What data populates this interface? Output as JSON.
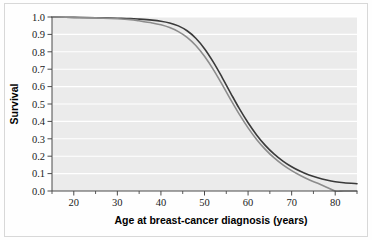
{
  "figure": {
    "background_color": "#fefefe",
    "frame_color": "#d8d8d8",
    "plot_background_color": "#ebebeb",
    "gridline_color": "#ffffff",
    "axis_color": "#4a4a4a"
  },
  "chart_data": {
    "type": "line",
    "title": "",
    "subtitle": "",
    "xlabel": "Age at breast-cancer diagnosis (years)",
    "ylabel": "Survival",
    "xlim": [
      15,
      85
    ],
    "ylim": [
      0.0,
      1.0
    ],
    "grid": true,
    "grid_axis": "y",
    "legend": "none",
    "xticks": [
      20,
      30,
      40,
      50,
      60,
      70,
      80
    ],
    "xtick_labels": [
      "20",
      "30",
      "40",
      "50",
      "60",
      "70",
      "80"
    ],
    "xminor_ticks": [
      15,
      25,
      35,
      45,
      55,
      65,
      75,
      85
    ],
    "yticks": [
      0.0,
      0.1,
      0.2,
      0.3,
      0.4,
      0.5,
      0.6,
      0.7,
      0.8,
      0.9,
      1.0
    ],
    "ytick_labels": [
      "0.0",
      "0.1",
      "0.2",
      "0.3",
      "0.4",
      "0.5",
      "0.6",
      "0.7",
      "0.8",
      "0.9",
      "1.0"
    ],
    "x": [
      15,
      20,
      25,
      30,
      33,
      35,
      38,
      40,
      42,
      44,
      46,
      48,
      50,
      52,
      54,
      56,
      58,
      60,
      62,
      64,
      66,
      68,
      70,
      72,
      74,
      76,
      78,
      80,
      82,
      85
    ],
    "series": [
      {
        "name": "dark-curve",
        "color": "#3a3a3a",
        "width": 1.6,
        "values": [
          1.0,
          0.998,
          0.996,
          0.993,
          0.991,
          0.988,
          0.982,
          0.976,
          0.966,
          0.949,
          0.921,
          0.878,
          0.818,
          0.742,
          0.655,
          0.563,
          0.473,
          0.392,
          0.321,
          0.261,
          0.212,
          0.172,
          0.139,
          0.113,
          0.092,
          0.076,
          0.063,
          0.053,
          0.047,
          0.042
        ]
      },
      {
        "name": "gray-curve",
        "color": "#8c8c8c",
        "width": 1.6,
        "values": [
          1.0,
          0.998,
          0.995,
          0.99,
          0.985,
          0.978,
          0.966,
          0.955,
          0.939,
          0.916,
          0.883,
          0.836,
          0.774,
          0.699,
          0.614,
          0.525,
          0.44,
          0.363,
          0.295,
          0.238,
          0.19,
          0.15,
          0.117,
          0.089,
          0.065,
          0.044,
          0.022,
          0.0,
          0.0,
          0.0
        ]
      }
    ]
  }
}
